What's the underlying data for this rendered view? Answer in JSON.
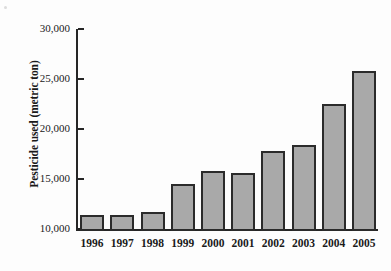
{
  "chart_data": {
    "type": "bar",
    "title": "",
    "xlabel": "",
    "ylabel": "Pesticide used (metric ton)",
    "categories": [
      "1996",
      "1997",
      "1998",
      "1999",
      "2000",
      "2001",
      "2002",
      "2003",
      "2004",
      "2005"
    ],
    "values": [
      11400,
      11400,
      11700,
      14500,
      15800,
      15600,
      17800,
      18400,
      22500,
      25800
    ],
    "ylim": [
      10000,
      30000
    ],
    "yticks": [
      10000,
      15000,
      20000,
      25000,
      30000
    ],
    "ytick_labels": [
      "10,000",
      "15,000",
      "20,000",
      "25,000",
      "30,000"
    ],
    "grid": false,
    "legend": false,
    "bar_color": "#a9a9a9",
    "bar_edge_color": "#2b2b2b",
    "axis_color": "#262626"
  },
  "axes": {
    "y_title": "Pesticide used (metric ton)"
  }
}
